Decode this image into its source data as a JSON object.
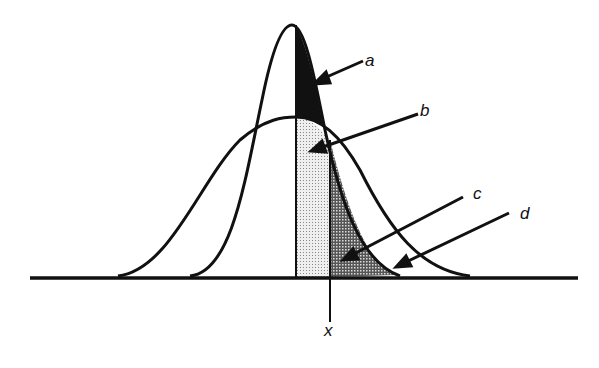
{
  "figure": {
    "labels": {
      "a": "a",
      "b": "b",
      "c": "c",
      "d": "d",
      "x": "x"
    },
    "colors": {
      "ink": "#111111",
      "region_a": "#111111",
      "region_b": "#d8d8d8",
      "region_c": "#6a6a6a",
      "background": "#ffffff"
    }
  }
}
